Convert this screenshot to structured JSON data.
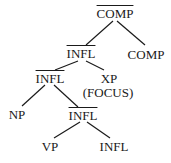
{
  "diagram": {
    "type": "syntax-tree",
    "nodes": [
      {
        "id": "comp_bar",
        "label": "COMP",
        "bar": true,
        "x": 115,
        "y": 7
      },
      {
        "id": "infl_bar_1",
        "label": "INFL",
        "bar": true,
        "x": 81,
        "y": 47
      },
      {
        "id": "comp",
        "label": "COMP",
        "bar": false,
        "x": 146,
        "y": 48
      },
      {
        "id": "infl_bar_2",
        "label": "INFL",
        "bar": true,
        "x": 50,
        "y": 72
      },
      {
        "id": "xp",
        "label": "XP",
        "bar": false,
        "x": 109,
        "y": 72
      },
      {
        "id": "focus",
        "label": "(FOCUS)",
        "bar": false,
        "x": 108,
        "y": 86
      },
      {
        "id": "np",
        "label": "NP",
        "bar": false,
        "x": 17,
        "y": 108
      },
      {
        "id": "infl_bar_3",
        "label": "INFL",
        "bar": true,
        "x": 83,
        "y": 109
      },
      {
        "id": "vp",
        "label": "VP",
        "bar": false,
        "x": 50,
        "y": 140
      },
      {
        "id": "infl",
        "label": "INFL",
        "bar": false,
        "x": 114,
        "y": 140
      }
    ],
    "edges": [
      {
        "from": [
          113,
          21
        ],
        "to": [
          86,
          45
        ]
      },
      {
        "from": [
          117,
          21
        ],
        "to": [
          145,
          45
        ]
      },
      {
        "from": [
          78,
          61
        ],
        "to": [
          55,
          70
        ]
      },
      {
        "from": [
          86,
          61
        ],
        "to": [
          104,
          70
        ]
      },
      {
        "from": [
          45,
          85
        ],
        "to": [
          22,
          106
        ]
      },
      {
        "from": [
          54,
          85
        ],
        "to": [
          78,
          107
        ]
      },
      {
        "from": [
          80,
          122
        ],
        "to": [
          54,
          138
        ]
      },
      {
        "from": [
          87,
          122
        ],
        "to": [
          110,
          138
        ]
      }
    ],
    "line_color": "#1a1a1a"
  }
}
